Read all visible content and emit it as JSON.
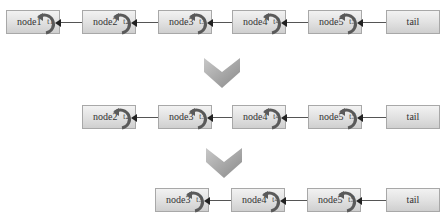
{
  "diagram": {
    "type": "linked-list-deletion",
    "rows": [
      {
        "nodes": [
          {
            "label": "node1",
            "pointer": "t1"
          },
          {
            "label": "node2",
            "pointer": "t2"
          },
          {
            "label": "node3",
            "pointer": "t3"
          },
          {
            "label": "node4",
            "pointer": "t4"
          },
          {
            "label": "node5",
            "pointer": "t5"
          },
          {
            "label": "tail"
          }
        ]
      },
      {
        "nodes": [
          {
            "label": "node2",
            "pointer": "t2"
          },
          {
            "label": "node3",
            "pointer": "t3"
          },
          {
            "label": "node4",
            "pointer": "t4"
          },
          {
            "label": "node5",
            "pointer": "t5"
          },
          {
            "label": "tail"
          }
        ]
      },
      {
        "nodes": [
          {
            "label": "node3",
            "pointer": "t3"
          },
          {
            "label": "node4",
            "pointer": "t4"
          },
          {
            "label": "node5",
            "pointer": "t5"
          },
          {
            "label": "tail"
          }
        ]
      }
    ],
    "transition_icon": "chevron-down-icon",
    "colors": {
      "node_fill_top": "#f2f2f2",
      "node_fill_bottom": "#cfcfcf",
      "node_border": "#a8a8a8",
      "loop_arrow": "#555555",
      "chevron": "#9a9a9a"
    }
  }
}
